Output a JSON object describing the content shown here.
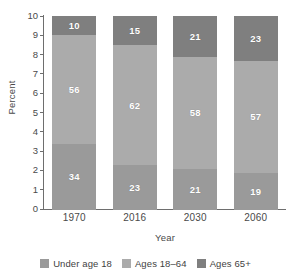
{
  "chart_data": {
    "type": "bar",
    "subtype": "stacked-percent",
    "title": "",
    "xlabel": "Year",
    "ylabel": "Percent",
    "categories": [
      "1970",
      "2016",
      "2030",
      "2060"
    ],
    "ylim": [
      0,
      10
    ],
    "yticks": [
      "0",
      "1",
      "2",
      "3",
      "4",
      "5",
      "6",
      "7",
      "8",
      "9",
      "10"
    ],
    "grid": false,
    "legend_position": "bottom",
    "series": [
      {
        "name": "Under age 18",
        "color": "#9a9a9a",
        "values": [
          34,
          23,
          21,
          19
        ]
      },
      {
        "name": "Ages 18–64",
        "color": "#ababab",
        "values": [
          56,
          62,
          58,
          57
        ]
      },
      {
        "name": "Ages 65+",
        "color": "#7f7f7f",
        "values": [
          10,
          15,
          21,
          23
        ]
      }
    ]
  },
  "axes": {
    "y_title": "Percent",
    "x_title": "Year",
    "y_ticks": [
      {
        "label": "10",
        "value": 10
      },
      {
        "label": "9",
        "value": 9
      },
      {
        "label": "8",
        "value": 8
      },
      {
        "label": "7",
        "value": 7
      },
      {
        "label": "6",
        "value": 6
      },
      {
        "label": "5",
        "value": 5
      },
      {
        "label": "4",
        "value": 4
      },
      {
        "label": "3",
        "value": 3
      },
      {
        "label": "2",
        "value": 2
      },
      {
        "label": "1",
        "value": 1
      },
      {
        "label": "0",
        "value": 0
      }
    ],
    "x_ticks": [
      "1970",
      "2016",
      "2030",
      "2060"
    ]
  },
  "bars": [
    {
      "year": "1970",
      "segments": [
        {
          "series": "Ages 65+",
          "label": "10",
          "value": 10
        },
        {
          "series": "Ages 18–64",
          "label": "56",
          "value": 56
        },
        {
          "series": "Under age 18",
          "label": "34",
          "value": 34
        }
      ]
    },
    {
      "year": "2016",
      "segments": [
        {
          "series": "Ages 65+",
          "label": "15",
          "value": 15
        },
        {
          "series": "Ages 18–64",
          "label": "62",
          "value": 62
        },
        {
          "series": "Under age 18",
          "label": "23",
          "value": 23
        }
      ]
    },
    {
      "year": "2030",
      "segments": [
        {
          "series": "Ages 65+",
          "label": "21",
          "value": 21
        },
        {
          "series": "Ages 18–64",
          "label": "58",
          "value": 58
        },
        {
          "series": "Under age 18",
          "label": "21",
          "value": 21
        }
      ]
    },
    {
      "year": "2060",
      "segments": [
        {
          "series": "Ages 65+",
          "label": "23",
          "value": 23
        },
        {
          "series": "Ages 18–64",
          "label": "57",
          "value": 57
        },
        {
          "series": "Under age 18",
          "label": "19",
          "value": 19
        }
      ]
    }
  ],
  "legend": {
    "items": [
      {
        "label": "Under age 18",
        "color": "#9a9a9a"
      },
      {
        "label": "Ages 18–64",
        "color": "#ababab"
      },
      {
        "label": "Ages 65+",
        "color": "#7f7f7f"
      }
    ]
  }
}
